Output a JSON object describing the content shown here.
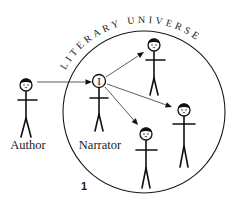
{
  "diagram": {
    "title": "LITERARY UNIVERSE",
    "page_number": "1",
    "universe_circle": {
      "cx": 144,
      "cy": 112,
      "r": 81,
      "stroke": "#1a1a1a"
    },
    "title_arc": {
      "radius": 89,
      "start_deg": -152,
      "end_deg": -30
    },
    "figures": [
      {
        "id": "author",
        "label": "Author",
        "head": {
          "cx": 26,
          "cy": 85,
          "r": 6
        },
        "arms_y": 100,
        "arms_x": [
          18,
          37
        ],
        "body_end_y": 118,
        "feet_y": 137,
        "feet_dx": 5,
        "label_x": 28,
        "label_y": 149,
        "head_glyph": ""
      },
      {
        "id": "narrator",
        "label": "Narrator",
        "head": {
          "cx": 99,
          "cy": 81,
          "r": 6.5
        },
        "arms_y": 98,
        "arms_x": [
          90,
          108
        ],
        "body_end_y": 114,
        "feet_y": 131,
        "feet_dx": 4,
        "label_x": 100,
        "label_y": 149,
        "head_glyph": "I"
      },
      {
        "id": "character-top",
        "label": "",
        "head": {
          "cx": 154,
          "cy": 45,
          "r": 6
        },
        "arms_y": 60,
        "arms_x": [
          146,
          165
        ],
        "body_end_y": 78,
        "feet_y": 95,
        "feet_dx": 4,
        "label_x": 0,
        "label_y": 0,
        "head_glyph": ""
      },
      {
        "id": "character-right",
        "label": "",
        "head": {
          "cx": 184,
          "cy": 110,
          "r": 6
        },
        "arms_y": 124,
        "arms_x": [
          173,
          195
        ],
        "body_end_y": 146,
        "feet_y": 167,
        "feet_dx": 4,
        "label_x": 0,
        "label_y": 0,
        "head_glyph": ""
      },
      {
        "id": "character-bottom",
        "label": "",
        "head": {
          "cx": 146,
          "cy": 134,
          "r": 6
        },
        "arms_y": 150,
        "arms_x": [
          136,
          157
        ],
        "body_end_y": 168,
        "feet_y": 188,
        "feet_dx": 4,
        "label_x": 0,
        "label_y": 0,
        "head_glyph": ""
      }
    ],
    "arrows": [
      {
        "from": "author",
        "to": "narrator",
        "x1": 37,
        "y1": 82,
        "x2": 92,
        "y2": 82
      },
      {
        "from": "narrator",
        "to": "character-top",
        "x1": 106,
        "y1": 77,
        "x2": 144,
        "y2": 52
      },
      {
        "from": "narrator",
        "to": "character-right",
        "x1": 107,
        "y1": 84,
        "x2": 172,
        "y2": 107
      },
      {
        "from": "narrator",
        "to": "character-bottom",
        "x1": 105,
        "y1": 87,
        "x2": 138,
        "y2": 125
      }
    ],
    "colors": {
      "ink": "#111111",
      "background": "#ffffff"
    }
  }
}
